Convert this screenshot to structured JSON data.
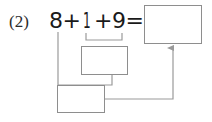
{
  "problem": {
    "number_label": "(2)",
    "equation": {
      "addend_1": "8",
      "operator_1": "+",
      "addend_2": "1",
      "operator_2": "+",
      "addend_3": "9",
      "equals": "="
    }
  },
  "boxes": {
    "sum_total": {
      "name": "total-sum-box",
      "value": ""
    },
    "partial_sum": {
      "name": "partial-sum-box",
      "value": ""
    },
    "final_answer": {
      "name": "final-answer-box",
      "value": ""
    }
  },
  "connectors": {
    "bracket_label": "grouping-bracket-under-1-plus-9",
    "line_from_8": "line-from-addend-8-to-final-answer-box",
    "line_partial_to_final": "line-from-partial-sum-box-to-final-answer-box",
    "arrow_to_total": "arrow-from-final-answer-box-to-total-sum-box"
  },
  "colors": {
    "ink": "#1a1a1a",
    "box_stroke": "#8e8e8e",
    "connector_stroke": "#9a9a9a",
    "background": "#ffffff"
  }
}
